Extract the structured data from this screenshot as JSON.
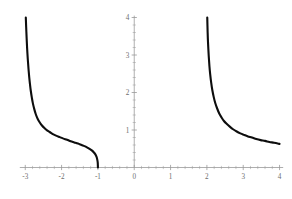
{
  "figure": {
    "background_color": "#ffffff",
    "width": 292,
    "height": 199
  },
  "chart_data": {
    "type": "line",
    "title": "",
    "subtitle": "",
    "xlabel": "",
    "ylabel": "",
    "xlim": [
      -3.2,
      4.15
    ],
    "ylim": [
      -0.28,
      4.2
    ],
    "grid": false,
    "legend": null,
    "legend_position": "none",
    "axis_color": "#999999",
    "curve_color": "#0d0d0d",
    "curve_width": 2.1,
    "x_ticks_major": [
      -3,
      -2,
      -1,
      0,
      1,
      2,
      3,
      4
    ],
    "x_tick_labels": [
      "-3",
      "-2",
      "-1",
      "0",
      "1",
      "2",
      "3",
      "4"
    ],
    "x_ticks_minor": [
      -2.8,
      -2.6,
      -2.4,
      -2.2,
      -1.8,
      -1.6,
      -1.4,
      -1.2,
      -0.8,
      -0.6,
      -0.4,
      -0.2,
      0.2,
      0.4,
      0.6,
      0.8,
      1.2,
      1.4,
      1.6,
      1.8,
      2.2,
      2.4,
      2.6,
      2.8,
      3.2,
      3.4,
      3.6,
      3.8
    ],
    "y_ticks_major": [
      1,
      2,
      3,
      4
    ],
    "y_tick_labels": [
      "1",
      "2",
      "3",
      "4"
    ],
    "y_ticks_minor": [
      0.2,
      0.4,
      0.6,
      0.8,
      1.2,
      1.4,
      1.6,
      1.8,
      2.2,
      2.4,
      2.6,
      2.8,
      3.2,
      3.4,
      3.6,
      3.8
    ],
    "axis_origin": [
      0,
      0
    ],
    "x_axis_range_drawn": [
      -3.15,
      4.1
    ],
    "y_axis_range_drawn": [
      0,
      4.05
    ],
    "vertical_asymptotes": [
      -3.0,
      2.0
    ],
    "series": [
      {
        "name": "left-branch",
        "description": "Left branch: rises steeply toward vertical asymptote near x = -3, falls with an inflection and meets the x-axis at x = -1.",
        "x": [
          -2.985,
          -2.97,
          -2.95,
          -2.93,
          -2.91,
          -2.89,
          -2.87,
          -2.85,
          -2.82,
          -2.79,
          -2.75,
          -2.71,
          -2.66,
          -2.6,
          -2.54,
          -2.47,
          -2.4,
          -2.32,
          -2.24,
          -2.15,
          -2.05,
          -1.95,
          -1.85,
          -1.75,
          -1.65,
          -1.55,
          -1.45,
          -1.37,
          -1.29,
          -1.22,
          -1.16,
          -1.11,
          -1.07,
          -1.04,
          -1.02,
          -1.005,
          -1.0
        ],
        "y": [
          4.0,
          3.62,
          3.2,
          2.88,
          2.62,
          2.4,
          2.22,
          2.06,
          1.87,
          1.71,
          1.55,
          1.42,
          1.3,
          1.2,
          1.12,
          1.05,
          0.99,
          0.94,
          0.89,
          0.85,
          0.81,
          0.77,
          0.74,
          0.7,
          0.67,
          0.64,
          0.6,
          0.57,
          0.53,
          0.49,
          0.45,
          0.4,
          0.35,
          0.29,
          0.22,
          0.13,
          0.0
        ]
      },
      {
        "name": "right-branch",
        "description": "Right branch: drops from the top of the frame along the vertical asymptote at x = 2 and decays toward about y = 0.6 at x = 4.",
        "x": [
          2.01,
          2.02,
          2.03,
          2.05,
          2.07,
          2.09,
          2.12,
          2.15,
          2.19,
          2.23,
          2.28,
          2.34,
          2.4,
          2.47,
          2.55,
          2.63,
          2.72,
          2.82,
          2.92,
          3.02,
          3.13,
          3.24,
          3.36,
          3.48,
          3.6,
          3.72,
          3.85,
          4.0
        ],
        "y": [
          4.0,
          3.62,
          3.35,
          2.98,
          2.7,
          2.49,
          2.25,
          2.06,
          1.87,
          1.72,
          1.58,
          1.44,
          1.34,
          1.24,
          1.16,
          1.09,
          1.02,
          0.96,
          0.91,
          0.87,
          0.83,
          0.8,
          0.76,
          0.73,
          0.71,
          0.68,
          0.66,
          0.63
        ]
      }
    ]
  }
}
